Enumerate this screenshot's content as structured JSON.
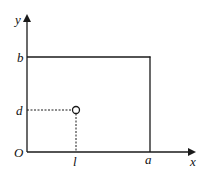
{
  "diagram": {
    "type": "coordinate-plot",
    "axes": {
      "x_label": "x",
      "y_label": "y",
      "origin_label": "O"
    },
    "ticks": {
      "x": [
        "l",
        "a"
      ],
      "y": [
        "d",
        "b"
      ]
    },
    "rectangle": {
      "description": "Region bounded by axes, x = a and y = b",
      "corner_labels": {
        "width": "a",
        "height": "b"
      }
    },
    "point": {
      "marker": "open-circle",
      "x_label": "l",
      "y_label": "d"
    },
    "colors": {
      "line": "#1a1a1a",
      "background": "#ffffff"
    }
  }
}
